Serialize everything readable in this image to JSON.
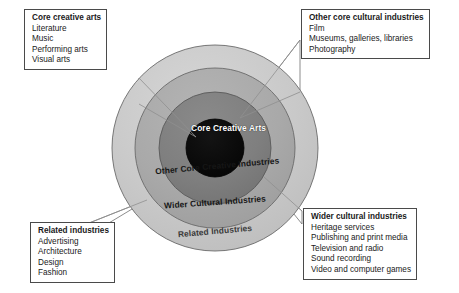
{
  "diagram": {
    "center": {
      "x": 215,
      "y": 148
    },
    "rings": [
      {
        "name": "core-creative-arts",
        "label": "Core\nCreative\nArts",
        "radius": 29,
        "fill": "#0a0a0a",
        "text_color": "#ffffff"
      },
      {
        "name": "other-core-creative-industries",
        "label": "Other Core Creative Industries",
        "radius": 56,
        "fill": "#808080",
        "text_color": "#161616"
      },
      {
        "name": "wider-cultural-industries",
        "label": "Wider Cultural Industries",
        "radius": 80,
        "fill": "#a8a8a8",
        "text_color": "#161616"
      },
      {
        "name": "related-industries",
        "label": "Related Industries",
        "radius": 103,
        "fill": "#c8c8c8",
        "text_color": "#3a3a3a"
      }
    ],
    "ring_labels": {
      "core": {
        "line1": "Core",
        "line2": "Creative",
        "line3": "Arts"
      },
      "other_core": {
        "line1": "Other Core Creative",
        "line2": "Industries"
      },
      "wider": {
        "line1": "Wider Cultural",
        "line2": "Industries"
      },
      "related": {
        "line1": "Related Industries"
      }
    },
    "colors": {
      "core_fill": "#0a0a0a",
      "inner_ring_fill": "#808080",
      "middle_ring_fill": "#a8a8a8",
      "outer_ring_fill": "#c8c8c8",
      "ring_stroke": "#5a5a5a",
      "box_border": "#4a4a4a",
      "leader_stroke": "#6a6a6a",
      "background": "#ffffff"
    }
  },
  "callouts": {
    "core_creative_arts": {
      "heading": "Core creative arts",
      "items": [
        "Literature",
        "Music",
        "Performing arts",
        "Visual arts"
      ]
    },
    "other_core_cultural_industries": {
      "heading": "Other core cultural industries",
      "items": [
        "Film",
        "Museums, galleries, libraries",
        "Photography"
      ]
    },
    "related_industries": {
      "heading": "Related industries",
      "items": [
        "Advertising",
        "Architecture",
        "Design",
        "Fashion"
      ]
    },
    "wider_cultural_industries": {
      "heading": "Wider cultural industries",
      "items": [
        "Heritage services",
        "Publishing and print media",
        "Television and radio",
        "Sound recording",
        "Video and computer games"
      ]
    }
  }
}
